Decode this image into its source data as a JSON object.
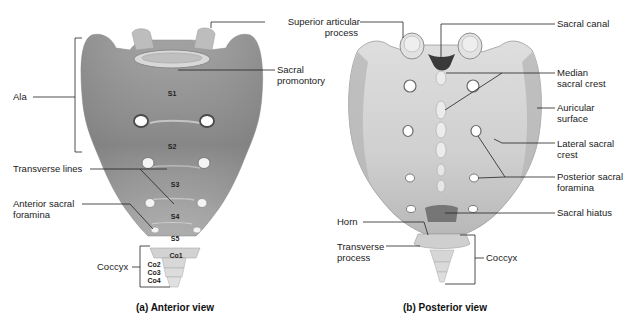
{
  "figure": {
    "panels": [
      {
        "id": "a",
        "caption": "(a) Anterior view",
        "labels": {
          "ala": "Ala",
          "transverse_lines": "Transverse lines",
          "anterior_sacral_foramina_1": "Anterior sacral",
          "anterior_sacral_foramina_2": "foramina",
          "coccyx": "Coccyx",
          "sacral_promontory_1": "Sacral",
          "sacral_promontory_2": "promontory"
        },
        "segments": [
          "S1",
          "S2",
          "S3",
          "S4",
          "S5",
          "Co1",
          "Co2",
          "Co3",
          "Co4"
        ]
      },
      {
        "id": "b",
        "caption": "(b) Posterior view",
        "labels": {
          "superior_articular_process_1": "Superior articular",
          "superior_articular_process_2": "process",
          "sacral_canal": "Sacral canal",
          "median_sacral_crest_1": "Median",
          "median_sacral_crest_2": "sacral crest",
          "auricular_surface_1": "Auricular",
          "auricular_surface_2": "surface",
          "lateral_sacral_crest_1": "Lateral sacral",
          "lateral_sacral_crest_2": "crest",
          "posterior_sacral_foramina_1": "Posterior sacral",
          "posterior_sacral_foramina_2": "foramina",
          "sacral_hiatus": "Sacral hiatus",
          "horn": "Horn",
          "transverse_process_1": "Transverse",
          "transverse_process_2": "process",
          "coccyx": "Coccyx"
        }
      }
    ],
    "colors": {
      "bone_anterior_dark": "#8a8a8a",
      "bone_anterior_light": "#c8c8c8",
      "bone_posterior": "#d4d4d4",
      "bone_posterior_shadow": "#a8a8a8",
      "leader_line": "#222222",
      "background": "#ffffff"
    }
  }
}
